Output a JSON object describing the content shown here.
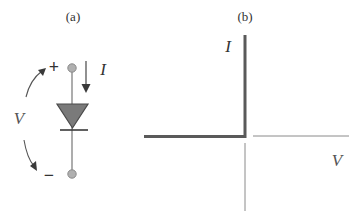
{
  "panel_a": {
    "label": "(a)",
    "current_symbol": "I",
    "voltage_symbol": "V",
    "plus_sign": "+",
    "minus_sign": "−",
    "component": "diode"
  },
  "panel_b": {
    "label": "(b)",
    "y_axis_label": "I",
    "x_axis_label": "V",
    "curve": "ideal diode I-V characteristic"
  },
  "colors": {
    "stroke_dark": "#5a5a5a",
    "stroke_light": "#8a8a8a",
    "diode_fill": "#7a7a7a",
    "terminal_fill": "#b0b0b0",
    "text": "#333333"
  }
}
